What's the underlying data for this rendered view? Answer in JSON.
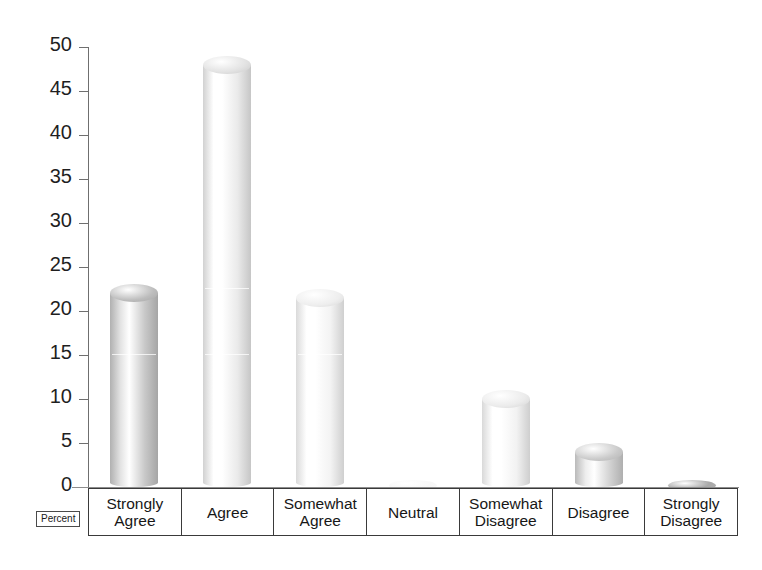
{
  "chart_data": {
    "type": "bar",
    "title": "",
    "subtitle": "",
    "xlabel": "",
    "ylabel": "Percent",
    "ylim": [
      0,
      50
    ],
    "yticks": [
      0,
      5,
      10,
      15,
      20,
      25,
      30,
      35,
      40,
      45,
      50
    ],
    "grid": false,
    "legend": "none",
    "style": "3d-cylinder",
    "categories": [
      "Strongly Agree",
      "Agree",
      "Somewhat Agree",
      "Neutral",
      "Somewhat Disagree",
      "Disagree",
      "Strongly Disagree"
    ],
    "category_lines": [
      [
        "Strongly",
        "Agree"
      ],
      [
        "Agree"
      ],
      [
        "Somewhat",
        "Agree"
      ],
      [
        "Neutral"
      ],
      [
        "Somewhat",
        "Disagree"
      ],
      [
        "Disagree"
      ],
      [
        "Strongly",
        "Disagree"
      ]
    ],
    "values": [
      22,
      48,
      21.5,
      0,
      10,
      4,
      0.3
    ],
    "bar_colors": [
      "#c9c9c9",
      "#eaeaea",
      "#f3f3f3",
      "#f0f0f0",
      "#f2f2f2",
      "#d3d3d3",
      "#b5b5b5"
    ],
    "bar_top_colors": [
      "#bdbdbd",
      "#e2e2e2",
      "#eeeeee",
      "#e8e8e8",
      "#ebebeb",
      "#cacaca",
      "#a9a9a9"
    ]
  },
  "axis": {
    "y_tick_labels": [
      "50",
      "45",
      "40",
      "35",
      "30",
      "25",
      "20",
      "15",
      "10",
      "5",
      "0"
    ],
    "corner_label": "Percent"
  }
}
